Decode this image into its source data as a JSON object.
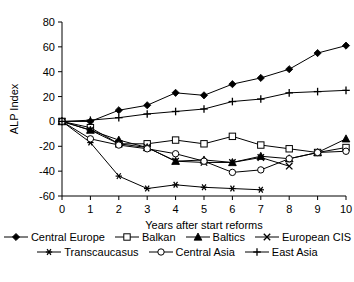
{
  "chart_data": {
    "type": "line",
    "title": "",
    "xlabel": "Years after start reforms",
    "ylabel": "ALP Index",
    "x": [
      0,
      1,
      2,
      3,
      4,
      5,
      6,
      7,
      8,
      9,
      10
    ],
    "xlim": [
      0,
      10
    ],
    "ylim": [
      -60,
      80
    ],
    "xticks": [
      "0",
      "1",
      "2",
      "3",
      "4",
      "5",
      "6",
      "7",
      "8",
      "9",
      "10"
    ],
    "yticks": [
      "-60",
      "-40",
      "-20",
      "0",
      "20",
      "40",
      "60",
      "80"
    ],
    "grid": false,
    "legend_position": "bottom",
    "series": [
      {
        "name": "Central Europe",
        "marker": "filled-diamond",
        "color": "#000000",
        "x": [
          0,
          1,
          2,
          3,
          4,
          5,
          6,
          7,
          8,
          9,
          10
        ],
        "values": [
          0,
          0,
          9,
          13,
          23,
          21,
          30,
          35,
          42,
          55,
          61
        ]
      },
      {
        "name": "Balkan",
        "marker": "open-square",
        "color": "#000000",
        "x": [
          0,
          1,
          2,
          3,
          4,
          5,
          6,
          7,
          8,
          9,
          10
        ],
        "values": [
          0,
          -5,
          -18,
          -18,
          -15,
          -18,
          -12,
          -19,
          -22,
          -25,
          -21
        ]
      },
      {
        "name": "Baltics",
        "marker": "filled-triangle",
        "color": "#000000",
        "x": [
          0,
          1,
          2,
          3,
          4,
          5,
          6,
          7,
          8,
          9,
          10
        ],
        "values": [
          0,
          -7,
          -15,
          -21,
          -32,
          -31,
          -33,
          -28,
          -30,
          -25,
          -14
        ]
      },
      {
        "name": "European CIS",
        "marker": "cross-x",
        "color": "#000000",
        "x": [
          0,
          1,
          2,
          3,
          4,
          5,
          6,
          7,
          8
        ],
        "values": [
          0,
          -7,
          -18,
          -21,
          -32,
          -33,
          -33,
          -29,
          -36
        ]
      },
      {
        "name": "Transcaucasus",
        "marker": "asterisk",
        "color": "#000000",
        "x": [
          0,
          1,
          2,
          3,
          4,
          5,
          6,
          7
        ],
        "values": [
          0,
          -17,
          -44,
          -54,
          -51,
          -53,
          -54,
          -55
        ]
      },
      {
        "name": "Central Asia",
        "marker": "open-circle",
        "color": "#000000",
        "x": [
          0,
          1,
          2,
          3,
          4,
          5,
          6,
          7,
          8,
          9,
          10
        ],
        "values": [
          0,
          -14,
          -19,
          -22,
          -26,
          -32,
          -41,
          -39,
          -30,
          -25,
          -24
        ]
      },
      {
        "name": "East Asia",
        "marker": "plus",
        "color": "#000000",
        "x": [
          0,
          1,
          2,
          3,
          4,
          5,
          6,
          7,
          8,
          9,
          10
        ],
        "values": [
          0,
          1,
          3,
          6,
          8,
          10,
          16,
          18,
          23,
          24,
          25
        ]
      }
    ]
  },
  "axes": {
    "ylabel": "ALP Index",
    "xlabel": "Years after start reforms"
  },
  "legend": {
    "rows": [
      [
        "Central Europe",
        "Balkan",
        "Baltics",
        "European CIS"
      ],
      [
        "Transcaucasus",
        "Central Asia",
        "East Asia"
      ]
    ]
  }
}
